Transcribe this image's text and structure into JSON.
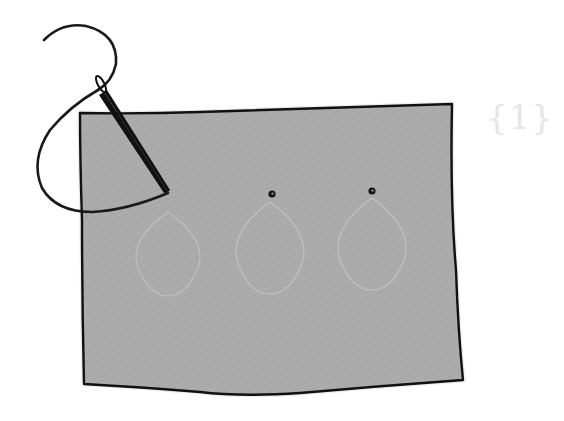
{
  "diagram": {
    "type": "sewing-illustration",
    "step_label": "{1}",
    "fabric": {
      "fill": "#acacac",
      "outline": "#111111"
    },
    "needle": {
      "color": "#111111"
    },
    "thread": {
      "color": "#1a1a1a"
    },
    "knots": [
      {
        "name": "knot-1",
        "x": 270,
        "y": 194
      },
      {
        "name": "knot-2",
        "x": 372,
        "y": 190
      }
    ],
    "pattern_outlines": [
      {
        "name": "petal-outline-1",
        "cx": 168,
        "cy": 250
      },
      {
        "name": "petal-outline-2",
        "cx": 270,
        "cy": 250
      },
      {
        "name": "petal-outline-3",
        "cx": 372,
        "cy": 248
      }
    ],
    "pattern_outline_color": "#c4c4c4"
  }
}
